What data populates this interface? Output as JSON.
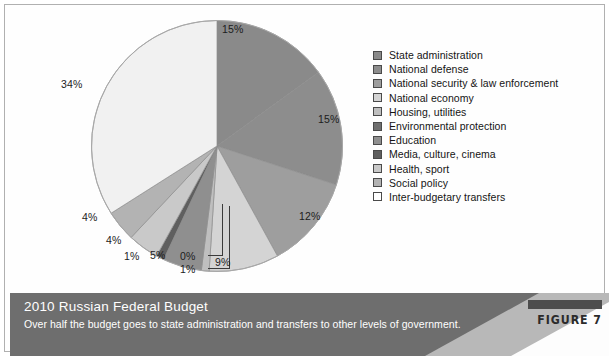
{
  "figure": {
    "tag_label": "FIGURE 7",
    "title": "2010 Russian Federal Budget",
    "caption": "Over half the budget goes to state administration and transfers to other levels of government."
  },
  "chart_data": {
    "type": "pie",
    "title": "2010 Russian Federal Budget",
    "xlabel": "",
    "ylabel": "",
    "legend_position": "right",
    "grid": false,
    "start_angle_deg": 0,
    "direction": "clockwise",
    "categories": [
      "State administration",
      "National defense",
      "National security & law enforcement",
      "National economy",
      "Housing, utilities",
      "Environmental protection",
      "Education",
      "Media, culture, cinema",
      "Health, sport",
      "Social policy",
      "Inter-budgetary transfers"
    ],
    "values": [
      15,
      15,
      12,
      9,
      1,
      0,
      5,
      1,
      4,
      4,
      34
    ],
    "data_labels": [
      "15%",
      "15%",
      "12%",
      "9%",
      "1%",
      "0%",
      "5%",
      "1%",
      "4%",
      "4%",
      "34%"
    ],
    "colors": [
      "#8a8a8a",
      "#8d8d8d",
      "#9e9e9e",
      "#d4d4d4",
      "#bfbfbf",
      "#6f6f6f",
      "#8f8f8f",
      "#5f5f5f",
      "#c9c9c9",
      "#b3b3b3",
      "#f1f1f1"
    ]
  },
  "legend": {
    "items": [
      {
        "label": "State administration",
        "color": "#8a8a8a"
      },
      {
        "label": "National defense",
        "color": "#8d8d8d"
      },
      {
        "label": "National security & law enforcement",
        "color": "#9e9e9e"
      },
      {
        "label": "National economy",
        "color": "#d4d4d4"
      },
      {
        "label": "Housing, utilities",
        "color": "#bfbfbf"
      },
      {
        "label": "Environmental protection",
        "color": "#6f6f6f"
      },
      {
        "label": "Education",
        "color": "#8f8f8f"
      },
      {
        "label": "Media, culture, cinema",
        "color": "#5f5f5f"
      },
      {
        "label": "Health, sport",
        "color": "#c9c9c9"
      },
      {
        "label": "Social policy",
        "color": "#b3b3b3"
      },
      {
        "label": "Inter-budgetary transfers",
        "color": "#ffffff"
      }
    ]
  }
}
